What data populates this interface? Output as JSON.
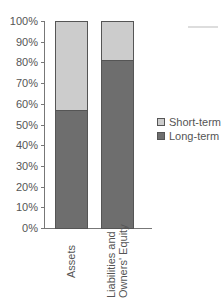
{
  "chart_data": {
    "type": "bar",
    "stacked": true,
    "title": "",
    "xlabel": "",
    "ylabel": "",
    "categories": [
      "Assets",
      "Liabilities and Owners' Equity"
    ],
    "series": [
      {
        "name": "Long-term",
        "values": [
          57,
          81
        ],
        "color": "#6e6e6e"
      },
      {
        "name": "Short-term",
        "values": [
          43,
          19
        ],
        "color": "#cccccc"
      }
    ],
    "ylim": [
      0,
      100
    ],
    "yticks": [
      "0%",
      "10%",
      "20%",
      "30%",
      "40%",
      "50%",
      "60%",
      "70%",
      "80%",
      "90%",
      "100%"
    ],
    "legend": [
      "Short-term",
      "Long-term"
    ],
    "legend_position": "right",
    "grid": false
  },
  "axis": {
    "yticks": [
      "0%",
      "10%",
      "20%",
      "30%",
      "40%",
      "50%",
      "60%",
      "70%",
      "80%",
      "90%",
      "100%"
    ],
    "xlabels": [
      "Assets",
      "Liabilities and",
      "Owners' Equity"
    ]
  },
  "legend": {
    "short_term": "Short-term",
    "long_term": "Long-term"
  }
}
